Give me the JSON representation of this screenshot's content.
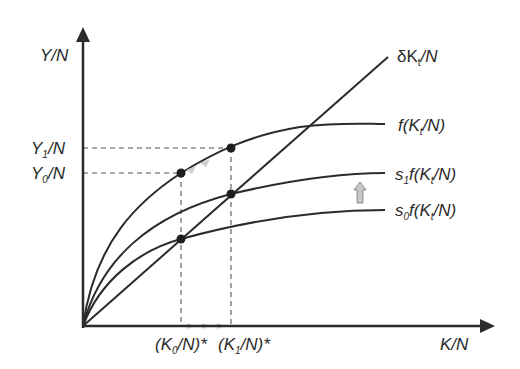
{
  "diagram": {
    "axes": {
      "y_label": "Y/N",
      "x_label": "K/N"
    },
    "y_ticks": [
      {
        "main": "Y",
        "sub": "1",
        "rest": "/N"
      },
      {
        "main": "Y",
        "sub": "0",
        "rest": "/N"
      }
    ],
    "x_ticks": [
      {
        "text": "(K",
        "sub": "0",
        "rest": "/N)*"
      },
      {
        "text": "(K",
        "sub": "1",
        "rest": "/N)*"
      }
    ],
    "curves": [
      {
        "id": "depreciation",
        "pre": "δK",
        "sub": "t",
        "post": "/N"
      },
      {
        "id": "production",
        "pre": "f(K",
        "sub": "t",
        "post": "/N)"
      },
      {
        "id": "savings-1",
        "pre": "s",
        "sub1": "1",
        "mid": "f(K",
        "sub": "t",
        "post": "/N)"
      },
      {
        "id": "savings-0",
        "pre": "s",
        "sub1": "0",
        "mid": "f(K",
        "sub": "t",
        "post": "/N)"
      }
    ],
    "shift_arrow": "up",
    "colors": {
      "line": "#2b2b2b",
      "arrow_fill": "#c8c8c8",
      "dash": "#555555"
    }
  }
}
